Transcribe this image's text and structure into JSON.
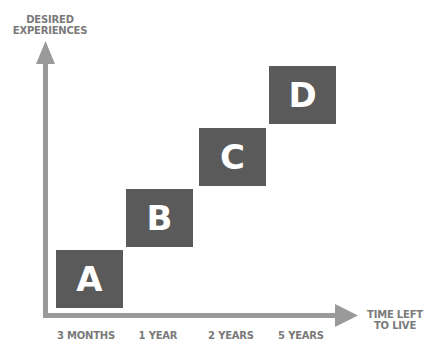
{
  "diagram": {
    "y_axis_label_line1": "DESIRED",
    "y_axis_label_line2": "EXPERIENCES",
    "x_axis_label_line1": "TIME LEFT",
    "x_axis_label_line2": "TO LIVE",
    "x_ticks": [
      "3 MONTHS",
      "1 YEAR",
      "2 YEARS",
      "5 YEARS"
    ],
    "boxes": [
      {
        "label": "A",
        "tick": "3 MONTHS",
        "level": 1
      },
      {
        "label": "B",
        "tick": "1 YEAR",
        "level": 2
      },
      {
        "label": "C",
        "tick": "2 YEARS",
        "level": 3
      },
      {
        "label": "D",
        "tick": "5 YEARS",
        "level": 4
      }
    ],
    "colors": {
      "box": "#5a5a5a",
      "axis": "#9a9a9a",
      "label_text": "#7a7a7a",
      "box_text": "#ffffff"
    }
  }
}
